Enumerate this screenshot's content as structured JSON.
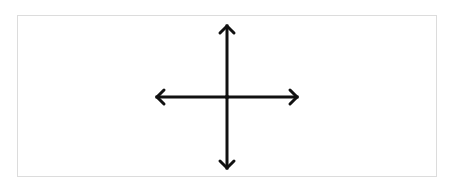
{
  "diagram": {
    "type": "four-way-arrow-cross",
    "frame": {
      "border_color": "#dcdcdc",
      "background": "#ffffff"
    },
    "stroke_color": "#111111",
    "stroke_width": 3,
    "center": [
      227,
      97
    ],
    "arrows": [
      {
        "direction": "up",
        "tip": [
          227,
          26
        ]
      },
      {
        "direction": "down",
        "tip": [
          227,
          168
        ]
      },
      {
        "direction": "left",
        "tip": [
          157,
          97
        ]
      },
      {
        "direction": "right",
        "tip": [
          297,
          97
        ]
      }
    ]
  }
}
